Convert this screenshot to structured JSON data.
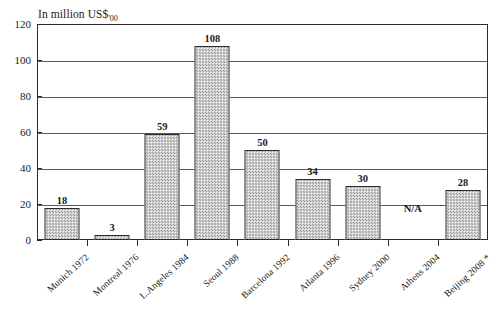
{
  "chart_data": {
    "type": "bar",
    "title": "",
    "subtitle": "",
    "unit_caption": "In million US$",
    "unit_caption_sub": "'00",
    "xlabel": "",
    "ylabel": "",
    "ylim": [
      0,
      120
    ],
    "grid": true,
    "legend": null,
    "ytick_labels": [
      "0",
      "20",
      "40",
      "60",
      "80",
      "100",
      "120"
    ],
    "ytick_values": [
      0,
      20,
      40,
      60,
      80,
      100,
      120
    ],
    "categories": [
      "Munich 1972",
      "Montreal 1976",
      "L.Angeles 1984",
      "Seoul 1988",
      "Barcelona 1992",
      "Atlanta 1996",
      "Sydney 2000",
      "Athens 2004",
      "Beijing 2008 *"
    ],
    "values": [
      18,
      3,
      59,
      108,
      50,
      34,
      30,
      null,
      28
    ],
    "value_labels": [
      "18",
      "3",
      "59",
      "108",
      "50",
      "34",
      "30",
      "N/A",
      "28"
    ],
    "missing_label": "N/A",
    "missing_index": 7,
    "colors": {
      "bar_fill": "#d6d6d6",
      "bar_edge": "#2b2b2b",
      "grid": "#58585a",
      "axis": "#2b2b2b",
      "background": "#ffffff",
      "text": "#1a1a1a"
    }
  }
}
